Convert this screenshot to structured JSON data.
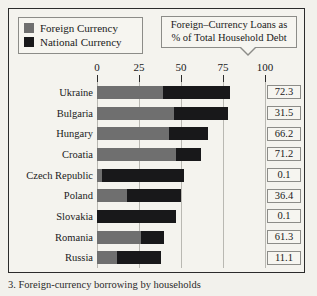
{
  "legend": {
    "items": [
      {
        "label": "Foreign Currency",
        "color": "#6f6f6f",
        "key": "foreign"
      },
      {
        "label": "National Currency",
        "color": "#18181a",
        "key": "national"
      }
    ]
  },
  "callout": {
    "line1": "Foreign–Currency Loans as",
    "line2": "% of Total Household Debt"
  },
  "caption": {
    "text": "3.  Foreign-currency borrowing by households"
  },
  "chart_data": {
    "type": "bar",
    "orientation": "horizontal",
    "stacked": true,
    "title": "Foreign–Currency Loans as % of Total Household Debt",
    "xlabel": "",
    "ylabel": "",
    "xlim": [
      0,
      100
    ],
    "ticks": [
      0,
      25,
      50,
      75,
      100
    ],
    "tick_labels": [
      "0",
      "25",
      "50",
      "75",
      "100"
    ],
    "grid": true,
    "legend_position": "top-left",
    "categories": [
      "Ukraine",
      "Bulgaria",
      "Hungary",
      "Croatia",
      "Czech Republic",
      "Poland",
      "Slovakia",
      "Romania",
      "Russia"
    ],
    "series": [
      {
        "name": "Foreign Currency",
        "color": "#6f6f6f",
        "values": [
          39,
          46,
          43,
          47,
          3,
          18,
          0,
          26,
          12
        ]
      },
      {
        "name": "National Currency",
        "color": "#18181a",
        "values": [
          40,
          32,
          23,
          15,
          49,
          32,
          47,
          14,
          26
        ]
      }
    ],
    "totals": [
      79,
      78,
      66,
      62,
      52,
      50,
      47,
      40,
      38
    ],
    "annotation_label": "Foreign-Currency Loans as % of Total Household Debt",
    "annotations": [
      {
        "category": "Ukraine",
        "value": "72.3"
      },
      {
        "category": "Bulgaria",
        "value": "31.5"
      },
      {
        "category": "Hungary",
        "value": "66.2"
      },
      {
        "category": "Croatia",
        "value": "71.2"
      },
      {
        "category": "Czech Republic",
        "value": "0.1"
      },
      {
        "category": "Poland",
        "value": "36.4"
      },
      {
        "category": "Slovakia",
        "value": "0.1"
      },
      {
        "category": "Romania",
        "value": "61.3"
      },
      {
        "category": "Russia",
        "value": "11.1"
      }
    ]
  }
}
